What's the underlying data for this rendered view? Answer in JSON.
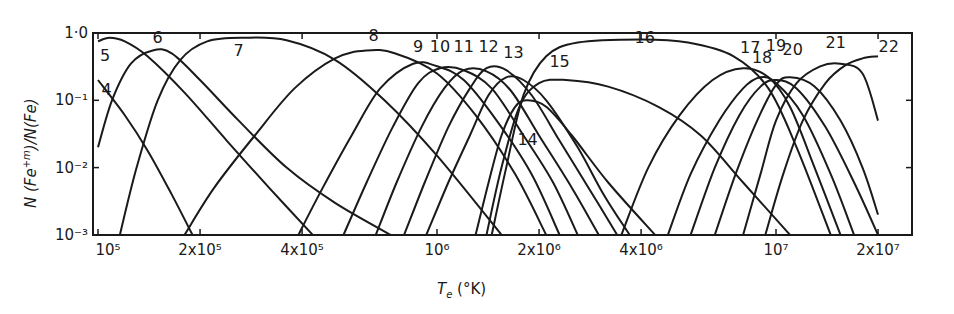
{
  "chart_data": {
    "type": "line",
    "title": "",
    "xlabel": "T_e (°K)",
    "ylabel": "N(Fe^+m)/N(Fe)",
    "xscale": "log",
    "yscale": "log",
    "xlim": [
      100000,
      26000000
    ],
    "ylim": [
      0.001,
      1.0
    ],
    "grid": false,
    "legend": "inline curve labels (ion charge m)",
    "x_ticks": [
      {
        "value": 100000,
        "label": "10⁵"
      },
      {
        "value": 200000,
        "label": "2x10⁵"
      },
      {
        "value": 400000,
        "label": "4x10⁵"
      },
      {
        "value": 1000000,
        "label": "10⁶"
      },
      {
        "value": 2000000,
        "label": "2x10⁶"
      },
      {
        "value": 4000000,
        "label": "4x10⁶"
      },
      {
        "value": 10000000,
        "label": "10⁷"
      },
      {
        "value": 20000000,
        "label": "2x10⁷"
      }
    ],
    "y_ticks": [
      {
        "value": 1.0,
        "label": "1·0"
      },
      {
        "value": 0.1,
        "label": "10⁻¹"
      },
      {
        "value": 0.01,
        "label": "10⁻²"
      },
      {
        "value": 0.001,
        "label": "10⁻³"
      }
    ],
    "series": [
      {
        "name": "4",
        "label_pos": [
          106000.0,
          0.12
        ],
        "points": [
          [
            100000.0,
            0.2
          ],
          [
            120000.0,
            0.06
          ],
          [
            140000.0,
            0.018
          ],
          [
            165000.0,
            0.004
          ],
          [
            190000.0,
            0.001
          ]
        ]
      },
      {
        "name": "5",
        "label_pos": [
          105000.0,
          0.38
        ],
        "points": [
          [
            100000.0,
            0.75
          ],
          [
            108000.0,
            0.85
          ],
          [
            120000.0,
            0.75
          ],
          [
            140000.0,
            0.45
          ],
          [
            180000.0,
            0.13
          ],
          [
            240000.0,
            0.025
          ],
          [
            320000.0,
            0.005
          ],
          [
            430000.0,
            0.001
          ]
        ]
      },
      {
        "name": "6",
        "label_pos": [
          150000.0,
          0.72
        ],
        "points": [
          [
            100000.0,
            0.02
          ],
          [
            110000.0,
            0.1
          ],
          [
            125000.0,
            0.35
          ],
          [
            145000.0,
            0.55
          ],
          [
            165000.0,
            0.5
          ],
          [
            200000.0,
            0.2
          ],
          [
            260000.0,
            0.05
          ],
          [
            360000.0,
            0.01
          ],
          [
            500000.0,
            0.003
          ],
          [
            730000.0,
            0.001
          ]
        ]
      },
      {
        "name": "7",
        "label_pos": [
          260000.0,
          0.45
        ],
        "points": [
          [
            116000.0,
            0.001
          ],
          [
            130000.0,
            0.01
          ],
          [
            150000.0,
            0.1
          ],
          [
            175000.0,
            0.4
          ],
          [
            210000.0,
            0.75
          ],
          [
            270000.0,
            0.85
          ],
          [
            360000.0,
            0.78
          ],
          [
            500000.0,
            0.4
          ],
          [
            700000.0,
            0.1
          ],
          [
            1000000.0,
            0.015
          ],
          [
            1550000.0,
            0.001
          ]
        ]
      },
      {
        "name": "8",
        "label_pos": [
          650000.0,
          0.75
        ],
        "points": [
          [
            180000.0,
            0.001
          ],
          [
            220000.0,
            0.005
          ],
          [
            290000.0,
            0.03
          ],
          [
            380000.0,
            0.15
          ],
          [
            500000.0,
            0.42
          ],
          [
            620000.0,
            0.55
          ],
          [
            750000.0,
            0.5
          ],
          [
            1000000.0,
            0.25
          ],
          [
            1300000.0,
            0.06
          ],
          [
            1700000.0,
            0.008
          ],
          [
            2100000.0,
            0.001
          ]
        ]
      },
      {
        "name": "9",
        "label_pos": [
          880000.0,
          0.52
        ],
        "points": [
          [
            390000.0,
            0.001
          ],
          [
            460000.0,
            0.005
          ],
          [
            560000.0,
            0.03
          ],
          [
            680000.0,
            0.15
          ],
          [
            850000.0,
            0.35
          ],
          [
            1000000.0,
            0.32
          ],
          [
            1200000.0,
            0.2
          ],
          [
            1500000.0,
            0.05
          ],
          [
            1900000.0,
            0.008
          ],
          [
            2300000.0,
            0.001
          ]
        ]
      },
      {
        "name": "10",
        "label_pos": [
          1020000.0,
          0.52
        ],
        "points": [
          [
            530000.0,
            0.001
          ],
          [
            620000.0,
            0.006
          ],
          [
            740000.0,
            0.04
          ],
          [
            880000.0,
            0.18
          ],
          [
            1020000.0,
            0.3
          ],
          [
            1200000.0,
            0.28
          ],
          [
            1450000.0,
            0.15
          ],
          [
            1800000.0,
            0.03
          ],
          [
            2200000.0,
            0.006
          ],
          [
            2600000.0,
            0.001
          ]
        ]
      },
      {
        "name": "11",
        "label_pos": [
          1200000.0,
          0.52
        ],
        "points": [
          [
            660000.0,
            0.001
          ],
          [
            760000.0,
            0.006
          ],
          [
            900000.0,
            0.04
          ],
          [
            1050000.0,
            0.15
          ],
          [
            1200000.0,
            0.28
          ],
          [
            1400000.0,
            0.27
          ],
          [
            1650000.0,
            0.14
          ],
          [
            2000000.0,
            0.03
          ],
          [
            2500000.0,
            0.005
          ],
          [
            3000000.0,
            0.001
          ]
        ]
      },
      {
        "name": "12",
        "label_pos": [
          1420000.0,
          0.52
        ],
        "points": [
          [
            800000.0,
            0.001
          ],
          [
            920000.0,
            0.006
          ],
          [
            1080000.0,
            0.04
          ],
          [
            1250000.0,
            0.15
          ],
          [
            1400000.0,
            0.3
          ],
          [
            1600000.0,
            0.28
          ],
          [
            1900000.0,
            0.12
          ],
          [
            2300000.0,
            0.025
          ],
          [
            2800000.0,
            0.005
          ],
          [
            3400000.0,
            0.001
          ]
        ]
      },
      {
        "name": "13",
        "label_pos": [
          1680000.0,
          0.42
        ],
        "points": [
          [
            930000.0,
            0.001
          ],
          [
            1080000.0,
            0.006
          ],
          [
            1250000.0,
            0.03
          ],
          [
            1420000.0,
            0.12
          ],
          [
            1600000.0,
            0.22
          ],
          [
            1800000.0,
            0.2
          ],
          [
            2100000.0,
            0.1
          ],
          [
            2600000.0,
            0.02
          ],
          [
            3100000.0,
            0.004
          ],
          [
            3700000.0,
            0.001
          ]
        ]
      },
      {
        "name": "14",
        "label_pos": [
          1850000.0,
          0.022
        ],
        "points": [
          [
            1300000.0,
            0.001
          ],
          [
            1420000.0,
            0.006
          ],
          [
            1550000.0,
            0.03
          ],
          [
            1700000.0,
            0.08
          ],
          [
            1850000.0,
            0.1
          ],
          [
            2100000.0,
            0.08
          ],
          [
            2500000.0,
            0.03
          ],
          [
            3200000.0,
            0.006
          ],
          [
            4400000.0,
            0.001
          ]
        ]
      },
      {
        "name": "15",
        "label_pos": [
          2300000.0,
          0.31
        ],
        "points": [
          [
            1400000.0,
            0.001
          ],
          [
            1550000.0,
            0.01
          ],
          [
            1750000.0,
            0.08
          ],
          [
            2000000.0,
            0.18
          ],
          [
            2400000.0,
            0.2
          ],
          [
            3200000.0,
            0.16
          ],
          [
            4500000.0,
            0.08
          ],
          [
            6000000.0,
            0.03
          ],
          [
            8000000.0,
            0.006
          ],
          [
            11000000.0,
            0.001
          ]
        ]
      },
      {
        "name": "16",
        "label_pos": [
          4100000.0,
          0.72
        ],
        "points": [
          [
            1450000.0,
            0.001
          ],
          [
            1600000.0,
            0.01
          ],
          [
            1800000.0,
            0.12
          ],
          [
            2100000.0,
            0.45
          ],
          [
            2600000.0,
            0.72
          ],
          [
            4000000.0,
            0.8
          ],
          [
            5500000.0,
            0.72
          ],
          [
            7500000.0,
            0.45
          ],
          [
            9500000.0,
            0.15
          ],
          [
            11500000.0,
            0.02
          ],
          [
            14500000.0,
            0.001
          ]
        ]
      },
      {
        "name": "17",
        "label_pos": [
          8400000.0,
          0.5
        ],
        "points": [
          [
            3500000.0,
            0.001
          ],
          [
            4200000.0,
            0.01
          ],
          [
            5200000.0,
            0.06
          ],
          [
            6500000.0,
            0.2
          ],
          [
            8000000.0,
            0.3
          ],
          [
            9500000.0,
            0.22
          ],
          [
            11000000.0,
            0.08
          ],
          [
            13000000.0,
            0.01
          ],
          [
            15500000.0,
            0.001
          ]
        ]
      },
      {
        "name": "18",
        "label_pos": [
          9100000.0,
          0.36
        ],
        "points": [
          [
            4800000.0,
            0.001
          ],
          [
            5600000.0,
            0.008
          ],
          [
            6800000.0,
            0.05
          ],
          [
            8000000.0,
            0.15
          ],
          [
            9000000.0,
            0.22
          ],
          [
            10000000.0,
            0.18
          ],
          [
            12000000.0,
            0.06
          ],
          [
            14500000.0,
            0.008
          ],
          [
            17000000.0,
            0.001
          ]
        ]
      },
      {
        "name": "19",
        "label_pos": [
          10000000.0,
          0.55
        ],
        "points": [
          [
            5600000.0,
            0.001
          ],
          [
            6600000.0,
            0.01
          ],
          [
            7800000.0,
            0.06
          ],
          [
            9000000.0,
            0.16
          ],
          [
            10000000.0,
            0.2
          ],
          [
            11500000.0,
            0.15
          ],
          [
            14000000.0,
            0.04
          ],
          [
            17000000.0,
            0.006
          ],
          [
            20000000.0,
            0.001
          ]
        ]
      },
      {
        "name": "20",
        "label_pos": [
          11200000.0,
          0.48
        ],
        "points": [
          [
            6600000.0,
            0.001
          ],
          [
            7600000.0,
            0.008
          ],
          [
            8800000.0,
            0.05
          ],
          [
            10000000.0,
            0.17
          ],
          [
            11000000.0,
            0.22
          ],
          [
            13000000.0,
            0.16
          ],
          [
            15500000.0,
            0.05
          ],
          [
            18000000.0,
            0.01
          ],
          [
            20000000.0,
            0.002
          ]
        ]
      },
      {
        "name": "21",
        "label_pos": [
          15000000.0,
          0.6
        ],
        "points": [
          [
            8000000.0,
            0.001
          ],
          [
            9000000.0,
            0.008
          ],
          [
            10000000.0,
            0.05
          ],
          [
            11500000.0,
            0.18
          ],
          [
            13500000.0,
            0.32
          ],
          [
            15500000.0,
            0.35
          ],
          [
            18000000.0,
            0.25
          ],
          [
            20000000.0,
            0.05
          ]
        ]
      },
      {
        "name": "22",
        "label_pos": [
          21500000.0,
          0.52
        ],
        "points": [
          [
            9300000.0,
            0.001
          ],
          [
            10500000.0,
            0.008
          ],
          [
            12000000.0,
            0.05
          ],
          [
            14000000.0,
            0.18
          ],
          [
            16000000.0,
            0.33
          ],
          [
            18000000.0,
            0.42
          ],
          [
            20000000.0,
            0.45
          ]
        ]
      }
    ]
  },
  "axes": {
    "ylabel_main": "N (Fe",
    "ylabel_sup": "+m",
    "ylabel_rest": ")/N(Fe)",
    "xlabel_main": "T",
    "xlabel_sub": "e",
    "xlabel_rest": " (°K)"
  },
  "colors": {
    "ink": "#1a1a1a",
    "background": "#ffffff"
  }
}
